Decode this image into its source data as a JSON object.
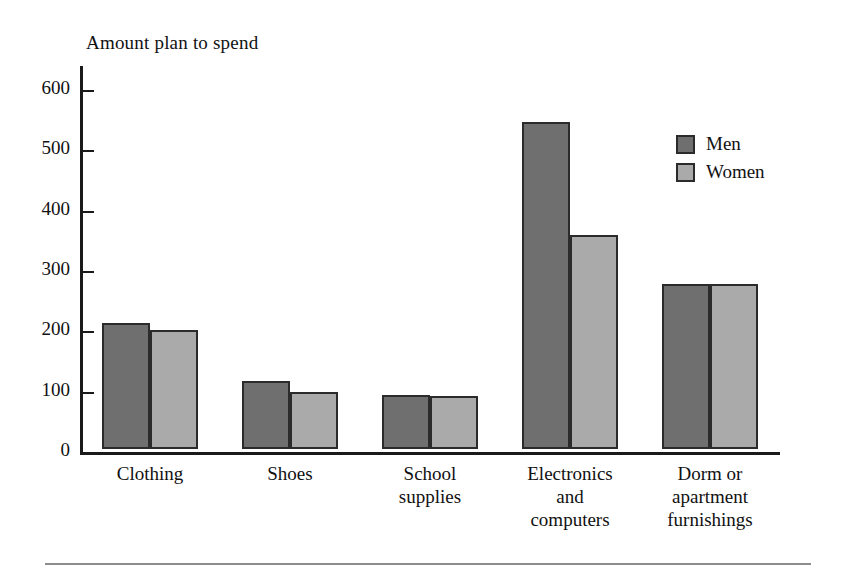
{
  "chart_data": {
    "type": "bar",
    "title": "Amount plan to spend",
    "xlabel": "",
    "ylabel": "Amount plan to spend",
    "ylim": [
      0,
      640
    ],
    "yticks": [
      0,
      100,
      200,
      300,
      400,
      500,
      600
    ],
    "ytick_labels": [
      "0",
      "100",
      "200",
      "300",
      "400",
      "500",
      "600"
    ],
    "grid": false,
    "legend_position": "top-right",
    "categories": [
      "Clothing",
      "Shoes",
      "School\nsupplies",
      "Electronics\nand\ncomputers",
      "Dorm or\napartment\nfurnishings"
    ],
    "series": [
      {
        "name": "Men",
        "color": "#6f6f6f",
        "values": [
          209,
          112,
          90,
          543,
          273
        ]
      },
      {
        "name": "Women",
        "color": "#aaaaaa",
        "values": [
          197,
          94,
          88,
          355,
          273
        ]
      }
    ]
  },
  "legend": {
    "items": [
      {
        "label": "Men",
        "color": "#6f6f6f"
      },
      {
        "label": "Women",
        "color": "#aaaaaa"
      }
    ]
  },
  "axis": {
    "tick_labels": [
      "600",
      "500",
      "400",
      "300",
      "200",
      "100",
      "0"
    ]
  },
  "colors": {
    "men": "#6f6f6f",
    "women": "#aaaaaa",
    "axis": "#1a1a1a",
    "bar_outline": "#2b2b2b",
    "rule": "#8d8d8d",
    "background": "#ffffff"
  }
}
